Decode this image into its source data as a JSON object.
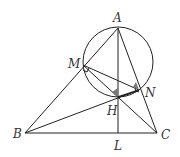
{
  "diagram": {
    "type": "geometry",
    "points": {
      "A": {
        "label": "A",
        "x": 118,
        "y": 28
      },
      "M": {
        "label": "M",
        "x": 83,
        "y": 65
      },
      "N": {
        "label": "N",
        "x": 139,
        "y": 90
      },
      "H": {
        "label": "H",
        "x": 118,
        "y": 97
      },
      "B": {
        "label": "B",
        "x": 25,
        "y": 133
      },
      "C": {
        "label": "C",
        "x": 157,
        "y": 133
      },
      "L": {
        "label": "L",
        "x": 118,
        "y": 133
      }
    },
    "circle": {
      "cx": 118,
      "cy": 62,
      "r": 35
    },
    "segments": [
      [
        "A",
        "B"
      ],
      [
        "A",
        "C"
      ],
      [
        "B",
        "C"
      ],
      [
        "A",
        "L"
      ],
      [
        "B",
        "N"
      ],
      [
        "C",
        "M"
      ],
      [
        "M",
        "N"
      ],
      [
        "M",
        "H"
      ],
      [
        "H",
        "N"
      ]
    ],
    "right_angles": [
      "M",
      "N"
    ],
    "shaded_angles": [
      "H",
      "N"
    ]
  }
}
